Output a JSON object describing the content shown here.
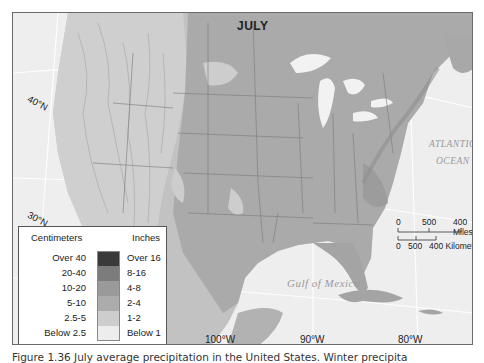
{
  "map": {
    "title": "JULY",
    "latitude_labels": [
      "40°N",
      "30°N"
    ],
    "longitude_labels": [
      "100°W",
      "90°W",
      "80°W"
    ],
    "water_labels": {
      "atlantic_line1": "ATLANTIC",
      "atlantic_line2": "OCEAN",
      "gulf": "Gulf of Mexico"
    },
    "colors": {
      "water": "#eeeeee",
      "land_base": "#bdbdbd",
      "over_16": "#3a3a3a",
      "8_16": "#7c7c7c",
      "4_8": "#9a9a9a",
      "2_4": "#ababab",
      "1_2": "#cccccc",
      "below_1": "#ececec",
      "border": "#6a6a6a"
    }
  },
  "scale_bar": {
    "miles": {
      "ticks": [
        "0",
        "500",
        "400 Miles"
      ]
    },
    "kilometers": {
      "ticks": [
        "0",
        "500",
        "400 Kilometers"
      ]
    }
  },
  "legend": {
    "header_cm": "Centimeters",
    "header_in": "Inches",
    "rows": [
      {
        "cm": "Over 40",
        "in": "Over 16",
        "color": "#3a3a3a"
      },
      {
        "cm": "20-40",
        "in": "8-16",
        "color": "#7c7c7c"
      },
      {
        "cm": "10-20",
        "in": "4-8",
        "color": "#9a9a9a"
      },
      {
        "cm": "5-10",
        "in": "2-4",
        "color": "#acacac"
      },
      {
        "cm": "2.5-5",
        "in": "1-2",
        "color": "#cdcdcd"
      },
      {
        "cm": "Below 2.5",
        "in": "Below 1",
        "color": "#ededed"
      }
    ]
  },
  "caption": "Figure 1.36 July average precipitation in the United States. Winter precipita"
}
